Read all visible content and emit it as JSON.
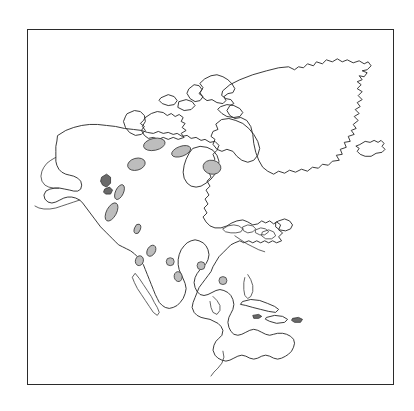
{
  "figure": {
    "kind": "outline-map",
    "region_title": "North America",
    "background_color": "#ffffff",
    "frame": {
      "visible": true,
      "color": "#2b2b2b",
      "x": 27,
      "y": 29,
      "width": 367,
      "height": 356
    },
    "line_color": "#2f2f2f",
    "shaded_island_fill": "#bdbdbd",
    "labels_visible": false,
    "graticule_visible": false,
    "legend_visible": false,
    "scale_bar_visible": false,
    "north_arrow_visible": false
  },
  "landmasses": [
    {
      "name": "mainland-north-america",
      "shaded": false
    },
    {
      "name": "greenland",
      "shaded": false
    },
    {
      "name": "iceland",
      "shaded": false
    },
    {
      "name": "baffin-island",
      "shaded": false
    },
    {
      "name": "victoria-island",
      "shaded": false
    },
    {
      "name": "banks-island",
      "shaded": false
    },
    {
      "name": "ellesmere-island",
      "shaded": false
    },
    {
      "name": "newfoundland",
      "shaded": false
    },
    {
      "name": "cuba",
      "shaded": false
    },
    {
      "name": "hispaniola",
      "shaded": false
    },
    {
      "name": "puerto-rico",
      "shaded": false
    },
    {
      "name": "vancouver-island",
      "shaded": true
    },
    {
      "name": "baja-california-peninsula",
      "shaded": false
    },
    {
      "name": "aleutian-islands",
      "shaded": false
    },
    {
      "name": "arctic-lakes-shaded",
      "shaded": true
    },
    {
      "name": "great-lakes",
      "shaded": false
    },
    {
      "name": "hudson-bay",
      "shaded": false
    }
  ],
  "water_bodies": [
    {
      "name": "hudson-bay"
    },
    {
      "name": "gulf-of-mexico"
    },
    {
      "name": "great-lakes"
    },
    {
      "name": "great-bear-lake"
    },
    {
      "name": "great-slave-lake"
    },
    {
      "name": "lake-winnipeg"
    }
  ]
}
